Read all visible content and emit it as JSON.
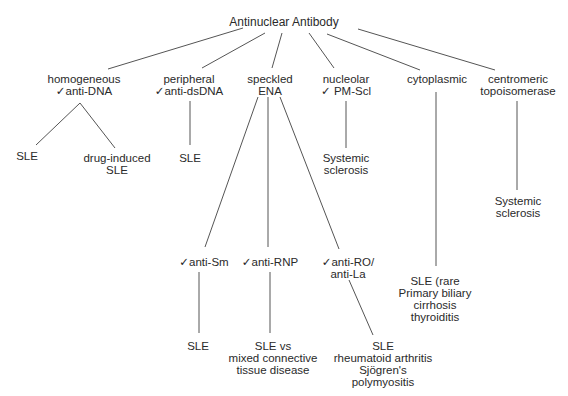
{
  "title": "Antinuclear Antibody",
  "check_mark": "✓",
  "nodes": {
    "root": {
      "lines": [
        "Antinuclear Antibody"
      ]
    },
    "homogeneous": {
      "lines": [
        "homogeneous",
        "anti-DNA"
      ],
      "checked_line": 1
    },
    "peripheral": {
      "lines": [
        "peripheral",
        "anti-dsDNA"
      ],
      "checked_line": 1
    },
    "speckled": {
      "lines": [
        "speckled",
        "ENA"
      ]
    },
    "nucleolar": {
      "lines": [
        "nucleolar",
        "PM-Scl"
      ],
      "checked_line": 1
    },
    "cytoplasmic": {
      "lines": [
        "cytoplasmic"
      ]
    },
    "centromeric": {
      "lines": [
        "centromeric",
        "topoisomerase"
      ]
    },
    "homog_sle": {
      "lines": [
        "SLE"
      ]
    },
    "homog_drug": {
      "lines": [
        "drug-induced",
        "SLE"
      ]
    },
    "periph_sle": {
      "lines": [
        "SLE"
      ]
    },
    "nucleolar_ss": {
      "lines": [
        "Systemic",
        "sclerosis"
      ]
    },
    "centromeric_ss": {
      "lines": [
        "Systemic",
        "sclerosis"
      ]
    },
    "anti_sm": {
      "lines": [
        "anti-Sm"
      ],
      "checked_line": 0
    },
    "anti_rnp": {
      "lines": [
        "anti-RNP"
      ],
      "checked_line": 0
    },
    "anti_ro": {
      "lines": [
        "anti-RO/",
        "anti-La"
      ],
      "checked_line": 0
    },
    "cyto_dx": {
      "lines": [
        "SLE (rare",
        "Primary biliary",
        "cirrhosis",
        "thyroiditis"
      ]
    },
    "sm_sle": {
      "lines": [
        "SLE"
      ]
    },
    "rnp_dx": {
      "lines": [
        "SLE vs",
        "mixed connective",
        "tissue disease"
      ]
    },
    "ro_dx": {
      "lines": [
        "SLE",
        "rheumatoid arthritis",
        "Sjögren's",
        "polymyositis"
      ]
    }
  }
}
